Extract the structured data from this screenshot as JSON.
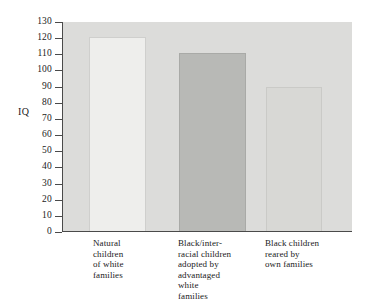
{
  "chart_data": {
    "type": "bar",
    "title": "",
    "xlabel": "",
    "ylabel": "IQ",
    "ylim": [
      0,
      130
    ],
    "yticks": [
      0,
      10,
      20,
      30,
      40,
      50,
      60,
      70,
      80,
      90,
      100,
      110,
      120,
      130
    ],
    "grid": false,
    "legend": null,
    "categories": [
      "Natural\nchildren\nof white\nfamilies",
      "Black/inter-\nracial children\nadopted by\nadvantaged\nwhite\nfamilies",
      "Black children\nreared by\nown families"
    ],
    "values": [
      120,
      110,
      89
    ],
    "bar_colors": [
      "#eeeeec",
      "#b8b9b6",
      "#d8d8d5"
    ],
    "plot_background": "#dcdcda",
    "axis_color": "#4a4a4a"
  },
  "axis": {
    "y_title": "IQ",
    "tick_labels": [
      "130",
      "120",
      "110",
      "100",
      "90",
      "80",
      "70",
      "60",
      "50",
      "40",
      "30",
      "20",
      "10",
      "0"
    ]
  }
}
